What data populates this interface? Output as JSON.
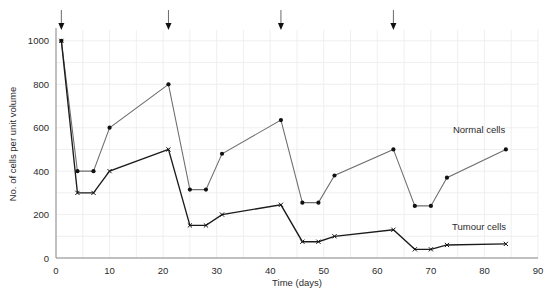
{
  "chart_data": {
    "type": "line",
    "title": "",
    "xlabel": "Time (days)",
    "ylabel": "No. of cells per unit volume",
    "xlim": [
      0,
      90
    ],
    "ylim": [
      0,
      1050
    ],
    "xticks": [
      0,
      10,
      20,
      30,
      40,
      50,
      60,
      70,
      80,
      90
    ],
    "yticks": [
      0,
      200,
      400,
      600,
      800,
      1000
    ],
    "xtick_labels": [
      "0",
      "10",
      "20",
      "30",
      "40",
      "50",
      "60",
      "70",
      "80",
      "90"
    ],
    "ytick_labels": [
      "0",
      "200",
      "400",
      "600",
      "800",
      "1000"
    ],
    "grid": true,
    "grid_x_step": 5,
    "grid_y_step": 100,
    "legend": "inline-labels",
    "annotations": [
      {
        "name": "treatment-arrow-1",
        "x": 1,
        "label": ""
      },
      {
        "name": "treatment-arrow-2",
        "x": 21,
        "label": ""
      },
      {
        "name": "treatment-arrow-3",
        "x": 42,
        "label": ""
      },
      {
        "name": "treatment-arrow-4",
        "x": 63,
        "label": ""
      }
    ],
    "series": [
      {
        "name": "Normal cells",
        "marker": "dot",
        "color": "#6e6e6e",
        "label_x": 79,
        "label_y": 575,
        "points": [
          {
            "x": 1,
            "y": 1000
          },
          {
            "x": 4,
            "y": 400
          },
          {
            "x": 7,
            "y": 400
          },
          {
            "x": 10,
            "y": 600
          },
          {
            "x": 21,
            "y": 800
          },
          {
            "x": 25,
            "y": 315
          },
          {
            "x": 28,
            "y": 315
          },
          {
            "x": 31,
            "y": 480
          },
          {
            "x": 42,
            "y": 635
          },
          {
            "x": 46,
            "y": 255
          },
          {
            "x": 49,
            "y": 255
          },
          {
            "x": 52,
            "y": 380
          },
          {
            "x": 63,
            "y": 500
          },
          {
            "x": 67,
            "y": 240
          },
          {
            "x": 70,
            "y": 240
          },
          {
            "x": 73,
            "y": 370
          },
          {
            "x": 84,
            "y": 500
          }
        ]
      },
      {
        "name": "Tumour cells",
        "marker": "x",
        "color": "#1b1b1b",
        "label_x": 79,
        "label_y": 130,
        "points": [
          {
            "x": 1,
            "y": 1000
          },
          {
            "x": 4,
            "y": 300
          },
          {
            "x": 7,
            "y": 300
          },
          {
            "x": 10,
            "y": 400
          },
          {
            "x": 21,
            "y": 500
          },
          {
            "x": 25,
            "y": 150
          },
          {
            "x": 28,
            "y": 150
          },
          {
            "x": 31,
            "y": 200
          },
          {
            "x": 42,
            "y": 245
          },
          {
            "x": 46,
            "y": 75
          },
          {
            "x": 49,
            "y": 75
          },
          {
            "x": 52,
            "y": 100
          },
          {
            "x": 63,
            "y": 130
          },
          {
            "x": 67,
            "y": 40
          },
          {
            "x": 70,
            "y": 40
          },
          {
            "x": 73,
            "y": 60
          },
          {
            "x": 84,
            "y": 65
          }
        ]
      }
    ]
  }
}
